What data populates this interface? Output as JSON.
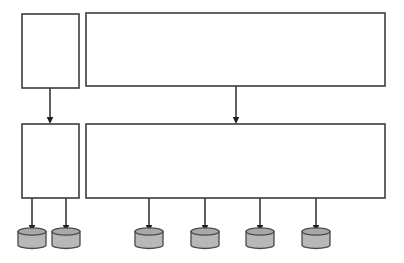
{
  "diagram": {
    "type": "block-flow-diagram",
    "canvas": {
      "width": 404,
      "height": 263,
      "background": "#ffffff"
    },
    "style": {
      "box_stroke": "#3d3d3d",
      "box_fill": "#ffffff",
      "box_stroke_width": 1.6,
      "connector_stroke": "#2b2b2b",
      "connector_stroke_width": 1.5,
      "arrowhead_fill": "#1f1f1f",
      "cylinder_fill": "#b8b8b8",
      "cylinder_top_fill": "#a8a8a8",
      "cylinder_stroke": "#4a4a4a"
    },
    "nodes": [
      {
        "id": "box-top-left",
        "name": "top-left-box",
        "label": "",
        "x": 22,
        "y": 14,
        "w": 57,
        "h": 74
      },
      {
        "id": "box-top-right",
        "name": "top-right-box",
        "label": "",
        "x": 86,
        "y": 13,
        "w": 299,
        "h": 73
      },
      {
        "id": "box-mid-left",
        "name": "middle-left-box",
        "label": "",
        "x": 22,
        "y": 124,
        "w": 57,
        "h": 74
      },
      {
        "id": "box-mid-right",
        "name": "middle-right-box",
        "label": "",
        "x": 86,
        "y": 124,
        "w": 299,
        "h": 74
      }
    ],
    "cylinders": [
      {
        "id": "cyl-1",
        "name": "database-cylinder-1",
        "label": "",
        "cx": 32,
        "cy": 240,
        "w": 28,
        "h": 17
      },
      {
        "id": "cyl-2",
        "name": "database-cylinder-2",
        "label": "",
        "cx": 66,
        "cy": 240,
        "w": 28,
        "h": 17
      },
      {
        "id": "cyl-3",
        "name": "database-cylinder-3",
        "label": "",
        "cx": 149,
        "cy": 240,
        "w": 28,
        "h": 17
      },
      {
        "id": "cyl-4",
        "name": "database-cylinder-4",
        "label": "",
        "cx": 205,
        "cy": 240,
        "w": 28,
        "h": 17
      },
      {
        "id": "cyl-5",
        "name": "database-cylinder-5",
        "label": "",
        "cx": 260,
        "cy": 240,
        "w": 28,
        "h": 17
      },
      {
        "id": "cyl-6",
        "name": "database-cylinder-6",
        "label": "",
        "cx": 316,
        "cy": 240,
        "w": 28,
        "h": 17
      }
    ],
    "connectors": [
      {
        "id": "arrow-1",
        "name": "arrow-top-left-to-middle-left",
        "label": "",
        "from": "box-top-left",
        "to": "box-mid-left",
        "x": 50,
        "y1": 88,
        "y2": 124
      },
      {
        "id": "arrow-2",
        "name": "arrow-top-right-to-middle-right",
        "label": "",
        "from": "box-top-right",
        "to": "box-mid-right",
        "x": 236,
        "y1": 86,
        "y2": 124
      },
      {
        "id": "arrow-3",
        "name": "arrow-middle-left-to-cylinder-1",
        "label": "",
        "from": "box-mid-left",
        "to": "cyl-1",
        "x": 32,
        "y1": 198,
        "y2": 232
      },
      {
        "id": "arrow-4",
        "name": "arrow-middle-left-to-cylinder-2",
        "label": "",
        "from": "box-mid-left",
        "to": "cyl-2",
        "x": 66,
        "y1": 198,
        "y2": 232
      },
      {
        "id": "arrow-5",
        "name": "arrow-middle-right-to-cylinder-3",
        "label": "",
        "from": "box-mid-right",
        "to": "cyl-3",
        "x": 149,
        "y1": 198,
        "y2": 232
      },
      {
        "id": "arrow-6",
        "name": "arrow-middle-right-to-cylinder-4",
        "label": "",
        "from": "box-mid-right",
        "to": "cyl-4",
        "x": 205,
        "y1": 198,
        "y2": 232
      },
      {
        "id": "arrow-7",
        "name": "arrow-middle-right-to-cylinder-5",
        "label": "",
        "from": "box-mid-right",
        "to": "cyl-5",
        "x": 260,
        "y1": 198,
        "y2": 232
      },
      {
        "id": "arrow-8",
        "name": "arrow-middle-right-to-cylinder-6",
        "label": "",
        "from": "box-mid-right",
        "to": "cyl-6",
        "x": 316,
        "y1": 198,
        "y2": 232
      }
    ]
  }
}
